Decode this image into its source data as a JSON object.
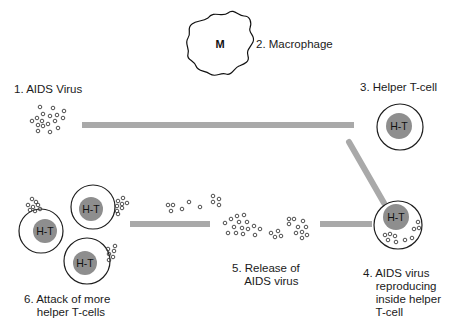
{
  "diagram": {
    "colors": {
      "arrow_bar": "#a9a9a9",
      "cell_nucleus": "#8e8e8e",
      "outline": "#1e1e1e"
    },
    "steps": [
      {
        "id": 1,
        "label": "1. AIDS Virus"
      },
      {
        "id": 2,
        "label": "2. Macrophage"
      },
      {
        "id": 3,
        "label": "3. Helper T-cell"
      },
      {
        "id": 4,
        "label": "4. AIDS virus\n    reproducing\n    inside helper\n    T-cell"
      },
      {
        "id": 5,
        "label": "5. Release of\n    AIDS virus"
      },
      {
        "id": 6,
        "label": "6. Attack of more\n    helper T-cells"
      }
    ],
    "macrophage_letter": "M",
    "cell_letter": "H-T"
  }
}
